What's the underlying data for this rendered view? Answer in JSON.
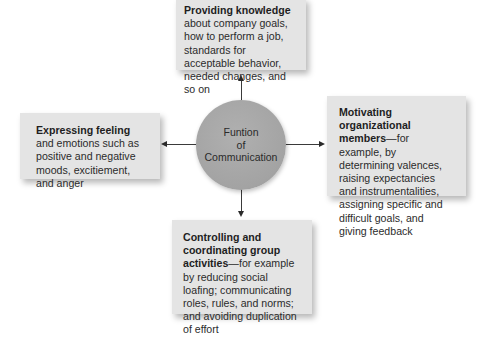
{
  "center": {
    "line1": "Funtion",
    "line2": "of",
    "line3": "Communication"
  },
  "top": {
    "title": "Providing knowledge",
    "text": " about company goals, how to perform a job, standards for acceptable behavior, needed changes, and so on"
  },
  "left": {
    "title": "Expressing feeling",
    "text": " and emotions such as positive and negative moods, excitiement, and anger"
  },
  "right": {
    "title": "Motivating organizational members",
    "text": "—for example, by determining valences, raising expectancies and instrumentalities, assigning specific and difficult goals, and giving feedback"
  },
  "bottom": {
    "title": "Controlling and coordinating group activities",
    "text": "—for example by reducing social loafing; communicating roles, rules, and norms; and avoiding duplication of effort"
  },
  "colors": {
    "box_fill": "#e4e4e4",
    "circle_fill": "#a6a6a6",
    "arrow": "#2a2a2a"
  }
}
